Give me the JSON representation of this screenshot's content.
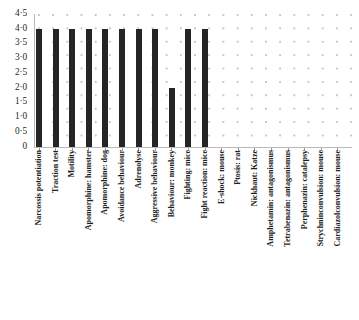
{
  "chart_data": {
    "type": "bar",
    "title": "",
    "subtitle": "",
    "xlabel": "",
    "ylabel": "",
    "ylim": [
      0,
      4.5
    ],
    "grid": "dotted",
    "legend": "none",
    "bar_color": "#252525",
    "categories": [
      "Narcossis potentiation",
      "Traction test",
      "Motility",
      "Apomorphine: hamster",
      "Apomorphine: dog",
      "Avoidance behaviour",
      "Adrenolyse",
      "Aggressive behaviour",
      "Behaviour: monkey",
      "Fighting: mice",
      "Fight reaction: mice",
      "E-shock: mouse",
      "Ptosis: rat",
      "Nickhaut: Katze",
      "Amphetamin: antagonismus",
      "Tetrabenazin: antagonismus",
      "Perphenazin: catalepsy",
      "Strychninconvulsion: mouse",
      "Cardiazolconvulsion: mouse"
    ],
    "values": [
      4.0,
      4.0,
      4.0,
      4.0,
      4.0,
      4.0,
      4.0,
      4.0,
      2.0,
      4.0,
      4.0,
      0,
      0,
      0,
      0,
      0,
      0,
      0,
      0
    ],
    "yticks": [
      0,
      0.5,
      1.0,
      1.5,
      2.0,
      2.5,
      3.0,
      3.5,
      4.0,
      4.5
    ],
    "ytick_labels": [
      "0",
      "0·5",
      "1·0",
      "1·5",
      "2·0",
      "2·5",
      "3·0",
      "3·5",
      "4·0",
      "4·5"
    ]
  }
}
